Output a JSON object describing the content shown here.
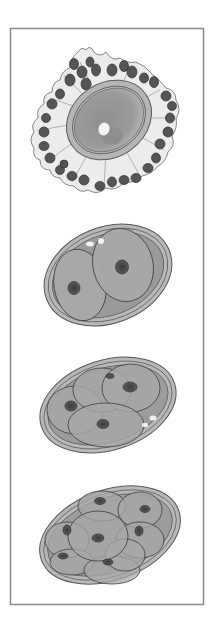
{
  "figure": {
    "title": "",
    "frame": {
      "x": 10,
      "y": 28,
      "width": 193,
      "height": 576,
      "stroke": "#8a8a8a"
    },
    "colors": {
      "background": "#ffffff",
      "zona": "#b5b5b5",
      "zona_dark": "#6e6e6e",
      "cytoplasm": "#a8a8a8",
      "cytoplasm_dark": "#8c8c8c",
      "nucleus": "#5a5a5a",
      "follicle_cell": "#555555",
      "follicle_fill": "#e2e2e2",
      "polar_body": "#ececec"
    },
    "stages": [
      {
        "name": "oocyte-with-corona-radiata",
        "cells": 1,
        "center": [
          108,
          118
        ]
      },
      {
        "name": "two-cell-stage",
        "cells": 2,
        "center": [
          108,
          275
        ]
      },
      {
        "name": "four-cell-stage",
        "cells": 4,
        "center": [
          108,
          405
        ]
      },
      {
        "name": "eight-cell-stage",
        "cells": 8,
        "center": [
          108,
          535
        ]
      }
    ]
  }
}
